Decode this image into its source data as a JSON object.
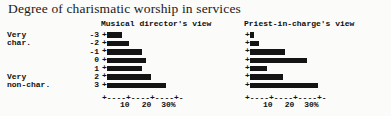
{
  "figure": {
    "title": "Degree of charismatic worship in services",
    "bar_color": "#141414",
    "background": "#fbfbf9"
  },
  "scale": {
    "labels": [
      {
        "text": "Very",
        "value": "-3"
      },
      {
        "text": "char.",
        "value": "-2"
      },
      {
        "text": "",
        "value": "-1"
      },
      {
        "text": "",
        "value": "0"
      },
      {
        "text": "",
        "value": "1"
      },
      {
        "text": "Very",
        "value": "2"
      },
      {
        "text": "non-char.",
        "value": "3"
      }
    ]
  },
  "axis": {
    "tick_labels": [
      "10",
      "20",
      "30%"
    ],
    "tick_values": [
      10,
      20,
      30
    ],
    "axis_line": "+----+----+----+-",
    "origin_marker": "+",
    "xlim": [
      0,
      32
    ]
  },
  "chart_data": {
    "type": "bar",
    "title": "Degree of charismatic worship in services",
    "xlabel": "",
    "ylabel": "",
    "xlim": [
      0,
      32
    ],
    "grid": false,
    "orientation": "horizontal",
    "legend": "none",
    "categories": [
      "-3",
      "-2",
      "-1",
      "0",
      "1",
      "2",
      "3"
    ],
    "category_labels": [
      "Very char. (-3)",
      "char. (-2)",
      "-1",
      "0",
      "1",
      "Very non-char. (2)",
      "non-char. (3)"
    ],
    "tick_labels": [
      "10",
      "20",
      "30%"
    ],
    "units": "percent",
    "panels": [
      {
        "name": "musical-director",
        "title": "Musical director's view",
        "values": [
          7,
          10,
          16,
          18,
          16,
          20,
          27
        ]
      },
      {
        "name": "priest-in-charge",
        "title": "Priest-in-charge's view",
        "values": [
          2,
          4,
          16,
          26,
          8,
          15,
          31
        ]
      }
    ]
  }
}
